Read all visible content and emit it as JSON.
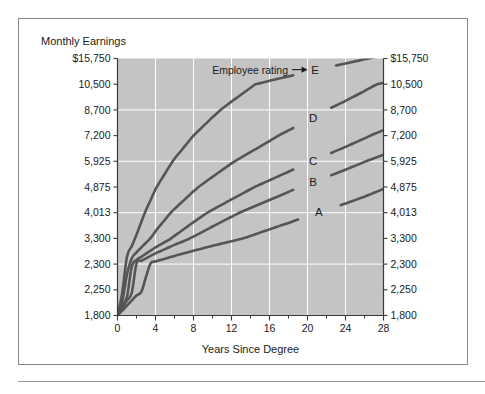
{
  "figure": {
    "title": "Monthly Earnings",
    "background_color": "#ffffff",
    "frame_color": "#8a8a8a"
  },
  "chart_data": {
    "type": "line",
    "title": "Monthly Earnings",
    "xlabel": "Years Since Degree",
    "ylabel": "Monthly Earnings",
    "plot_background": "#c4c4c4",
    "grid": true,
    "grid_color": "#ffffff",
    "curve_color": "#555555",
    "legend_position": "inline-right",
    "xlim": [
      0,
      28
    ],
    "ylim": [
      1800,
      15750
    ],
    "x_ticks": [
      0,
      4,
      8,
      12,
      16,
      20,
      24,
      28
    ],
    "x_tick_labels": [
      "0",
      "4",
      "8",
      "12",
      "16",
      "20",
      "24",
      "28"
    ],
    "x_minor_ticks": [
      2,
      6,
      10,
      14,
      18,
      22,
      26
    ],
    "y_ticks": [
      1800,
      2250,
      2300,
      3300,
      4013,
      4875,
      5925,
      7200,
      8700,
      10500,
      15750
    ],
    "y_tick_labels_left": [
      "1,800",
      "2,250",
      "2,300",
      "3,300",
      "4,013",
      "4,875",
      "5,925",
      "7,200",
      "8,700",
      "10,500",
      "$15,750"
    ],
    "y_tick_labels_right": [
      "1,800",
      "2,250",
      "2,300",
      "3,300",
      "4,013",
      "4,875",
      "5,925",
      "7,200",
      "8,700",
      "10,500",
      "$15,750"
    ],
    "y_gridline_values": [
      2300,
      4013,
      5925,
      8700
    ],
    "annotation": {
      "text": "Employee rating",
      "points_to": "E"
    },
    "series": [
      {
        "name": "A",
        "label": "A",
        "x": [
          0,
          2,
          4,
          6,
          8,
          10,
          12,
          14,
          16,
          18,
          20,
          22,
          24,
          26,
          28
        ],
        "values": [
          1800,
          2150,
          2400,
          2620,
          2820,
          3010,
          3190,
          3370,
          3550,
          3730,
          3920,
          4110,
          4320,
          4550,
          4810
        ]
      },
      {
        "name": "B",
        "label": "B",
        "x": [
          0,
          2,
          4,
          6,
          8,
          10,
          12,
          14,
          16,
          18,
          20,
          22,
          24,
          26,
          28
        ],
        "values": [
          1800,
          2330,
          2720,
          3050,
          3350,
          3630,
          3900,
          4170,
          4440,
          4710,
          4990,
          5280,
          5580,
          5900,
          6250
        ]
      },
      {
        "name": "C",
        "label": "C",
        "x": [
          0,
          2,
          4,
          6,
          8,
          10,
          12,
          14,
          16,
          18,
          20,
          22,
          24,
          26,
          28
        ],
        "values": [
          1800,
          2460,
          2950,
          3370,
          3750,
          4110,
          4460,
          4800,
          5150,
          5500,
          5860,
          6240,
          6640,
          7060,
          7520
        ]
      },
      {
        "name": "D",
        "label": "D",
        "x": [
          0,
          2,
          4,
          6,
          8,
          10,
          12,
          14,
          16,
          18,
          20,
          22,
          24,
          26,
          28
        ],
        "values": [
          1800,
          2760,
          3500,
          4140,
          4730,
          5290,
          5840,
          6380,
          6930,
          7500,
          8080,
          8690,
          9330,
          10020,
          10760
        ]
      },
      {
        "name": "E",
        "label": "E",
        "x": [
          0,
          2,
          4,
          6,
          8,
          10,
          12,
          14,
          16,
          18,
          20,
          22,
          24,
          26,
          28
        ],
        "values": [
          1800,
          3400,
          4800,
          6050,
          7200,
          8270,
          9280,
          10250,
          11190,
          12100,
          13000,
          13880,
          14740,
          15580,
          16400
        ]
      }
    ]
  }
}
